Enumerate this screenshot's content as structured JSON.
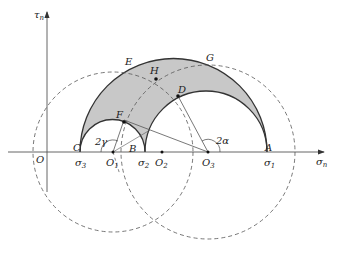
{
  "diagram": {
    "type": "Mohr stress circles",
    "axes": {
      "x_label": "σ",
      "x_label_sub": "n",
      "y_label": "τ",
      "y_label_sub": "n",
      "origin_label": "O"
    },
    "points": {
      "A": "A",
      "B": "B",
      "C": "C",
      "D": "D",
      "E": "E",
      "F": "F",
      "G": "G",
      "H": "H",
      "O1": "O",
      "O1_sub": "1",
      "O2": "O",
      "O2_sub": "2",
      "O3": "O",
      "O3_sub": "3"
    },
    "stresses": {
      "s1": "σ",
      "s1_sub": "1",
      "s2": "σ",
      "s2_sub": "2",
      "s3": "σ",
      "s3_sub": "3"
    },
    "angles": {
      "gamma": "2γ",
      "alpha": "2α"
    },
    "colors": {
      "shade": "#c8c8c8",
      "line": "#333333"
    }
  }
}
